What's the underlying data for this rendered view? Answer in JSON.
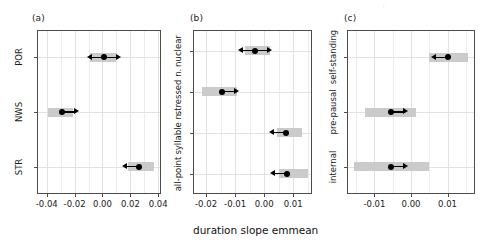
{
  "figure": {
    "xlabel": "duration slope emmean",
    "background": "#ffffff",
    "band_color": "#c8c8c8",
    "point_color": "#000000",
    "grid_color": "#e2e2e2"
  },
  "chart_data": [
    {
      "type": "scatter",
      "panel_tag": "(a)",
      "title": "",
      "xlabel": "duration slope emmean",
      "ylabel": "",
      "orientation": "horizontal",
      "grid": true,
      "legend": "none",
      "xlim": [
        -0.047,
        0.042
      ],
      "xticks": [
        -0.04,
        -0.02,
        0.0,
        0.02,
        0.04
      ],
      "xticklabels": [
        "-0.04",
        "-0.02",
        "0.00",
        "0.02",
        "0.04"
      ],
      "categories": [
        "POR",
        "NWS",
        "STR"
      ],
      "points": [
        {
          "category": "POR",
          "estimate": 0.001,
          "ci_low": -0.009,
          "ci_high": 0.01,
          "arrows": [
            "left",
            "right"
          ]
        },
        {
          "category": "NWS",
          "estimate": -0.029,
          "ci_low": -0.039,
          "ci_high": -0.021,
          "arrows": [
            "right"
          ]
        },
        {
          "category": "STR",
          "estimate": 0.026,
          "ci_low": 0.018,
          "ci_high": 0.037,
          "arrows": [
            "left"
          ]
        }
      ]
    },
    {
      "type": "scatter",
      "panel_tag": "(b)",
      "title": "",
      "xlabel": "duration slope emmean",
      "ylabel": "",
      "orientation": "horizontal",
      "grid": true,
      "legend": "none",
      "xlim": [
        -0.0245,
        0.0165
      ],
      "xticks": [
        -0.02,
        -0.01,
        0.0,
        0.01
      ],
      "xticklabels": [
        "-0.02",
        "-0.01",
        "0.00",
        "0.01"
      ],
      "categories": [
        "nuclear",
        "stressed n.",
        "syllable n.",
        "all-point"
      ],
      "points": [
        {
          "category": "nuclear",
          "estimate": -0.003,
          "ci_low": -0.0065,
          "ci_high": 0.002,
          "arrows": [
            "left",
            "right"
          ]
        },
        {
          "category": "stressed n.",
          "estimate": -0.0145,
          "ci_low": -0.0215,
          "ci_high": -0.0095,
          "arrows": [
            "right"
          ]
        },
        {
          "category": "syllable n.",
          "estimate": 0.0075,
          "ci_low": 0.0045,
          "ci_high": 0.013,
          "arrows": [
            "left"
          ]
        },
        {
          "category": "all-point",
          "estimate": 0.008,
          "ci_low": 0.005,
          "ci_high": 0.015,
          "arrows": [
            "left"
          ]
        }
      ]
    },
    {
      "type": "scatter",
      "panel_tag": "(c)",
      "title": "",
      "xlabel": "duration slope emmean",
      "ylabel": "",
      "orientation": "horizontal",
      "grid": true,
      "legend": "none",
      "xlim": [
        -0.0175,
        0.0175
      ],
      "xticks": [
        -0.01,
        0.0,
        0.01
      ],
      "xticklabels": [
        "-0.01",
        "0.00",
        "0.01"
      ],
      "categories": [
        "self-standing",
        "pre-pausal",
        "internal"
      ],
      "points": [
        {
          "category": "self-standing",
          "estimate": 0.01,
          "ci_low": 0.0048,
          "ci_high": 0.0155,
          "arrows": [
            "left"
          ]
        },
        {
          "category": "pre-pausal",
          "estimate": -0.0055,
          "ci_low": -0.0125,
          "ci_high": 0.0013,
          "arrows": [
            "right"
          ]
        },
        {
          "category": "internal",
          "estimate": -0.0055,
          "ci_low": -0.0155,
          "ci_high": 0.005,
          "arrows": [
            "right"
          ]
        }
      ]
    }
  ]
}
